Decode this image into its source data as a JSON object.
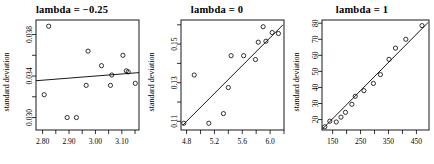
{
  "figure": {
    "panel_count": 3,
    "point_symbol": "open-circle",
    "line_color": "#000000",
    "background": "#ffffff"
  },
  "chart_data": [
    {
      "type": "scatter",
      "title": "lambda = −0.25",
      "xlabel": "",
      "ylabel": "standard deviation",
      "grid": false,
      "legend": "none",
      "xlim": [
        2.775,
        3.165
      ],
      "ylim": [
        0.0288,
        0.0394
      ],
      "xticks": [
        2.8,
        2.9,
        3.0,
        3.1
      ],
      "xticklabels": [
        "2.80",
        "2.90",
        "3.00",
        "3.10"
      ],
      "xminorticks": [
        2.85,
        2.95,
        3.05,
        3.15
      ],
      "yticks": [
        0.03,
        0.034,
        0.038
      ],
      "yticklabels": [
        "0.030",
        "0.034",
        "0.038"
      ],
      "yminorticks": [
        0.032,
        0.036
      ],
      "x": [
        2.806,
        2.823,
        2.893,
        2.928,
        2.965,
        2.972,
        3.023,
        3.057,
        3.062,
        3.104,
        3.117,
        3.124,
        3.151
      ],
      "y": [
        0.0322,
        0.0388,
        0.03,
        0.03,
        0.0331,
        0.0364,
        0.035,
        0.0331,
        0.0341,
        0.036,
        0.0345,
        0.0344,
        0.0333
      ],
      "fit_line": {
        "x": [
          2.775,
          3.165
        ],
        "y": [
          0.03355,
          0.03433
        ],
        "slope": 0.002,
        "type": "linear-regression"
      }
    },
    {
      "type": "scatter",
      "title": "lambda = 0",
      "xlabel": "",
      "ylabel": "standard deviation",
      "grid": false,
      "legend": "none",
      "xlim": [
        4.72,
        6.2
      ],
      "ylim": [
        0.1055,
        0.1625
      ],
      "xticks": [
        4.8,
        5.2,
        5.6,
        6.0
      ],
      "xticklabels": [
        "4.8",
        "5.2",
        "5.6",
        "6.0"
      ],
      "xminorticks": [
        5.0,
        5.4,
        5.8,
        6.2
      ],
      "yticks": [
        0.11,
        0.13,
        0.15
      ],
      "yticklabels": [
        "0.11",
        "0.13",
        "0.15"
      ],
      "yminorticks": [
        0.12,
        0.14,
        0.16
      ],
      "x": [
        4.76,
        4.91,
        5.12,
        5.33,
        5.4,
        5.44,
        5.62,
        5.79,
        5.83,
        5.9,
        5.94,
        6.03,
        6.12
      ],
      "y": [
        0.109,
        0.134,
        0.109,
        0.114,
        0.1275,
        0.144,
        0.144,
        0.142,
        0.151,
        0.159,
        0.1515,
        0.156,
        0.1555
      ],
      "fit_line": {
        "x": [
          4.745,
          6.185
        ],
        "y": [
          0.108,
          0.16
        ],
        "type": "linear-regression"
      }
    },
    {
      "type": "scatter",
      "title": "lambda = 1",
      "xlabel": "",
      "ylabel": "standard deviation",
      "grid": false,
      "legend": "none",
      "xlim": [
        112,
        495
      ],
      "ylim": [
        13.5,
        82
      ],
      "xticks": [
        150,
        250,
        350,
        450
      ],
      "xticklabels": [
        "150",
        "250",
        "350",
        "450"
      ],
      "xminorticks": [
        200,
        300,
        400
      ],
      "yticks": [
        20,
        30,
        40,
        50,
        60,
        70,
        80
      ],
      "yticklabels": [
        "20",
        "30",
        "40",
        "50",
        "60",
        "70",
        "80"
      ],
      "yminorticks": [],
      "x": [
        122,
        140,
        163,
        180,
        196,
        219,
        231,
        262,
        296,
        321,
        352,
        375,
        412,
        470
      ],
      "y": [
        15.5,
        19.0,
        18.5,
        21.5,
        24.5,
        29.5,
        34.5,
        38.0,
        42.5,
        48.0,
        57.5,
        64.5,
        70.0,
        78.5
      ],
      "fit_line": {
        "x": [
          113,
          492
        ],
        "y": [
          14.0,
          80.5
        ],
        "type": "linear-regression"
      }
    }
  ]
}
